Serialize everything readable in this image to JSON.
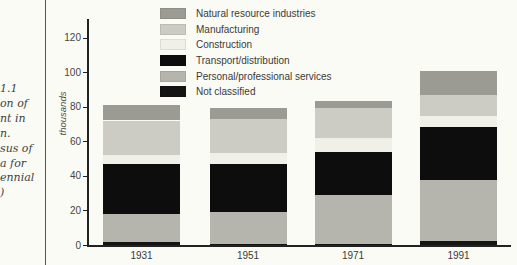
{
  "page": {
    "background": "#fbfbf5"
  },
  "caption": {
    "lines": [
      "1.1",
      "on of",
      "nt in",
      "n.",
      "sus of",
      "a for",
      "ennial",
      ")"
    ]
  },
  "legend": {
    "items": [
      {
        "label": "Natural resource industries",
        "color": "#9b9b93"
      },
      {
        "label": "Manufacturing",
        "color": "#ccccc4"
      },
      {
        "label": "Construction",
        "color": "#f0f0e8"
      },
      {
        "label": "Transport/distribution",
        "color": "#0d0d0d"
      },
      {
        "label": "Personal/professional services",
        "color": "#b5b5ad"
      },
      {
        "label": "Not classified",
        "color": "#141414"
      }
    ]
  },
  "chart_data": {
    "type": "bar",
    "stacked": true,
    "title": "",
    "ylabel": "thousands",
    "xlabel": "",
    "ylim": [
      0,
      130
    ],
    "yticks": [
      0,
      20,
      40,
      60,
      80,
      100,
      120
    ],
    "grid": false,
    "legend_position": "top-right",
    "categories": [
      "1931",
      "1951",
      "1971",
      "1991"
    ],
    "stack_order": "bottom_to_top",
    "series": [
      {
        "name": "Not classified",
        "color": "#141414",
        "values": [
          2,
          0.5,
          0.5,
          2.5
        ]
      },
      {
        "name": "Personal/professional services",
        "color": "#b5b5ad",
        "values": [
          16,
          18.5,
          28.5,
          35
        ]
      },
      {
        "name": "Transport/distribution",
        "color": "#0d0d0d",
        "values": [
          29,
          28,
          25,
          31
        ]
      },
      {
        "name": "Construction",
        "color": "#f0f0e8",
        "values": [
          5,
          6,
          8,
          6
        ]
      },
      {
        "name": "Manufacturing",
        "color": "#ccccc4",
        "values": [
          20,
          20,
          17,
          12
        ]
      },
      {
        "name": "Natural resource industries",
        "color": "#9b9b93",
        "values": [
          9,
          6,
          4.5,
          14
        ]
      }
    ],
    "totals": [
      81,
      79,
      83.5,
      100.5
    ]
  }
}
